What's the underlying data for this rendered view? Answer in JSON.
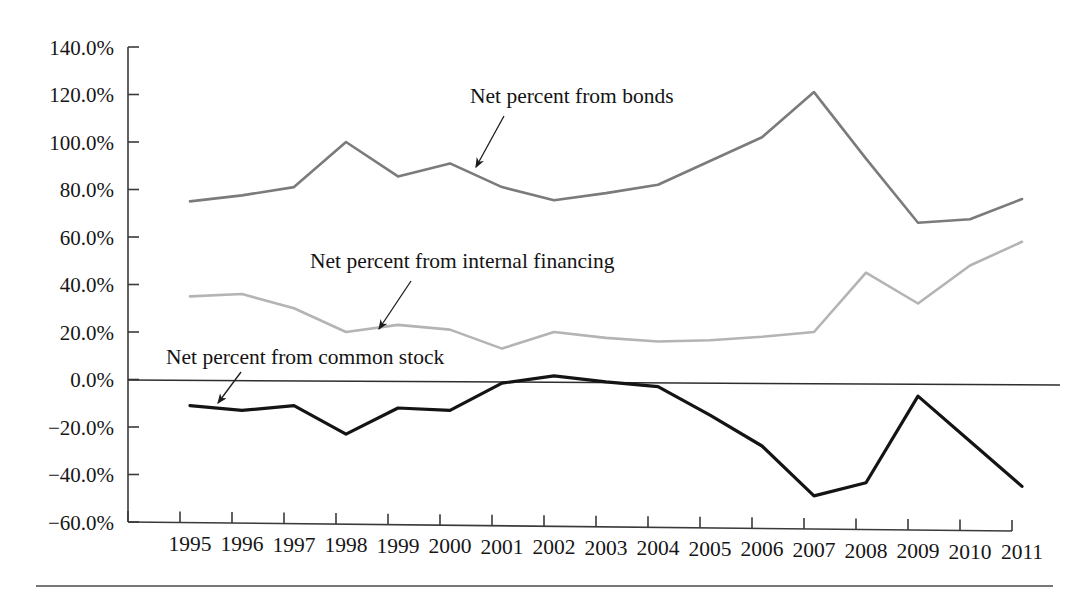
{
  "chart_data": {
    "type": "line",
    "title": "",
    "subtitle": "",
    "xlabel": "",
    "ylabel": "",
    "categories": [
      "1995",
      "1996",
      "1997",
      "1998",
      "1999",
      "2000",
      "2001",
      "2002",
      "2003",
      "2004",
      "2005",
      "2006",
      "2007",
      "2008",
      "2009",
      "2010",
      "2011"
    ],
    "x": [
      1995,
      1996,
      1997,
      1998,
      1999,
      2000,
      2001,
      2002,
      2003,
      2004,
      2005,
      2006,
      2007,
      2008,
      2009,
      2010,
      2011
    ],
    "xlim": [
      1995,
      2011
    ],
    "ylim": [
      -60,
      140
    ],
    "ytick_values": [
      140,
      120,
      100,
      80,
      60,
      40,
      20,
      0,
      -20,
      -40,
      -60
    ],
    "ytick_labels": [
      "140.0%",
      "120.0%",
      "100.0%",
      "80.0%",
      "60.0%",
      "40.0%",
      "20.0%",
      "0.0%",
      "−20.0%",
      "−40.0%",
      "−60.0%"
    ],
    "grid": false,
    "legend_position": "inline-annotations",
    "units": "percent",
    "series": [
      {
        "name": "Net percent from bonds",
        "color": "#7b7b7b",
        "width": 2.6,
        "values": [
          75.0,
          77.5,
          81.0,
          100.0,
          85.5,
          91.0,
          81.0,
          75.5,
          78.5,
          82.0,
          92.0,
          102.0,
          121.0,
          93.0,
          66.0,
          67.5,
          76.0
        ]
      },
      {
        "name": "Net percent from internal financing",
        "color": "#b4b4b4",
        "width": 2.6,
        "values": [
          35.0,
          36.0,
          30.0,
          20.0,
          23.0,
          21.0,
          13.0,
          20.0,
          17.5,
          16.0,
          16.5,
          18.0,
          20.0,
          45.0,
          32.0,
          48.0,
          58.0
        ]
      },
      {
        "name": "Net percent from common stock",
        "color": "#141414",
        "width": 3.2,
        "values": [
          -11.0,
          -13.0,
          -11.0,
          -23.0,
          -12.0,
          -13.0,
          -1.5,
          1.5,
          -1.0,
          -3.0,
          -15.0,
          -28.0,
          -49.0,
          -43.5,
          -7.0,
          -26.0,
          -45.0
        ]
      }
    ],
    "annotations": [
      {
        "text": "Net percent from bonds",
        "label_x": 470,
        "label_y": 103,
        "arrow_from_x": 504,
        "arrow_from_y": 116,
        "arrow_to_x": 476,
        "arrow_to_y": 167
      },
      {
        "text": "Net percent from internal financing",
        "label_x": 310,
        "label_y": 268,
        "arrow_from_x": 411,
        "arrow_from_y": 281,
        "arrow_to_x": 379,
        "arrow_to_y": 329
      },
      {
        "text": "Net percent from common stock",
        "label_x": 166,
        "label_y": 364,
        "arrow_from_x": 241,
        "arrow_from_y": 372,
        "arrow_to_x": 218,
        "arrow_to_y": 403
      }
    ]
  },
  "axes": {
    "y_axis_x": 128,
    "plot_top_y": 47,
    "plot_bottom_y": 522,
    "zero_y": 380,
    "first_point_x": 190,
    "point_spacing": 52,
    "tick_start_x": 128,
    "tick_spacing": 52,
    "tick_count": 18,
    "footer_rule": {
      "x1": 36,
      "x2": 1053,
      "y": 586
    }
  }
}
